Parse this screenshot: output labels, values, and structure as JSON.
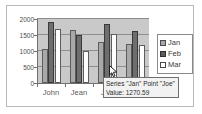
{
  "chart_data": {
    "type": "bar",
    "title": "",
    "xlabel": "",
    "ylabel": "",
    "categories": [
      "John",
      "Jean",
      "Joe",
      "Joan"
    ],
    "series": [
      {
        "name": "Jan",
        "color": "#a8a8a8",
        "values": [
          1050,
          1650,
          1270.59,
          1210
        ]
      },
      {
        "name": "Feb",
        "color": "#6e6e6e",
        "values": [
          1900,
          1490,
          1840,
          1630
        ]
      },
      {
        "name": "Mar",
        "color": "#ffffff",
        "values": [
          1680,
          990,
          1520,
          1200
        ]
      }
    ],
    "ylim": [
      0,
      2000
    ],
    "yticks": [
      0,
      500,
      1000,
      1500,
      2000
    ],
    "ytick_labels": [
      "0",
      "500",
      "1000",
      "1500",
      "2000"
    ],
    "grid": true,
    "legend_position": "right"
  },
  "legend": {
    "entries": [
      {
        "label": "Jan",
        "swatch": "jan-swatch-icon"
      },
      {
        "label": "Feb",
        "swatch": "feb-swatch-icon"
      },
      {
        "label": "Mar",
        "swatch": "mar-swatch-icon"
      }
    ]
  },
  "tooltip": {
    "line1": "Series \"Jan\" Point \"Joe\"",
    "line2": "Value: 1270.59"
  },
  "cursor": {
    "icon": "mouse-pointer-icon"
  },
  "colors": {
    "plot_background": "#c9c9c9",
    "gridline": "#8e8e8e",
    "axis": "#707070",
    "window_border": "#b9b9b9",
    "tooltip_background": "#f2f2f2",
    "tooltip_border": "#6f6f6f"
  }
}
